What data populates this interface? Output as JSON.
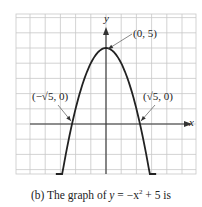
{
  "chart_data": {
    "type": "line",
    "title": "",
    "caption_prefix": "(b)  The graph of ",
    "caption_eq_var": "y",
    "caption_eq_rest": " = −x",
    "caption_exp": "2",
    "caption_suffix": " + 5 is",
    "xlabel": "x",
    "ylabel": "y",
    "function": "y = -x^2 + 5",
    "xlim": [
      -6,
      6
    ],
    "ylim": [
      -3.3,
      7.3
    ],
    "grid": true,
    "series": [
      {
        "name": "y = -x^2 + 5",
        "x": [
          -3.3,
          -3,
          -2.5,
          -2.236,
          -2,
          -1.5,
          -1,
          -0.5,
          0,
          0.5,
          1,
          1.5,
          2,
          2.236,
          2.5,
          3,
          3.3
        ],
        "y": [
          -5.89,
          -4,
          -1.25,
          0,
          1,
          2.75,
          4,
          4.75,
          5,
          4.75,
          4,
          2.75,
          1,
          0,
          -1.25,
          -4,
          -5.89
        ]
      }
    ],
    "annotations": [
      {
        "text": "(0, 5)",
        "point": [
          0,
          5
        ]
      },
      {
        "text": "(−√5, 0)",
        "point": [
          -2.236,
          0
        ]
      },
      {
        "text": "(√5, 0)",
        "point": [
          2.236,
          0
        ]
      }
    ]
  },
  "labels": {
    "vertex": "(0, 5)",
    "left_intercept": "(−√5, 0)",
    "right_intercept": "(√5, 0)",
    "x_axis": "x",
    "y_axis": "y"
  },
  "colors": {
    "grid": "#c8c8c8",
    "axis": "#333333",
    "curve": "#222222"
  }
}
